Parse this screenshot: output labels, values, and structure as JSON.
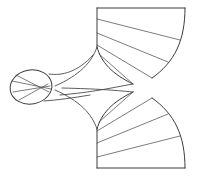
{
  "figure": {
    "background_color": "#ffffff",
    "stroke_color": "#4a4a4a",
    "outline_color": "#3c3c3c",
    "rule_color": "#5a5a5a",
    "canvas": {
      "width": 198,
      "height": 177
    },
    "parts": {
      "upper_fan": {
        "name": "upper-fan-sector",
        "top_edge": "M 97 8 L 185 8",
        "left_edge": "M 97 8 L 97 47",
        "arc_edge": "M 185 8 C 185 40 175 62 152 78",
        "inner_edge": "M 97 47 C 101 62 112 74 133 84",
        "rulings": [
          "M 97 19 L 180 40",
          "M 97 33 L 168 62",
          "M 97 45 L 152 78",
          "M 99 54 L 133 84"
        ]
      },
      "lower_fan": {
        "name": "lower-fan-sector",
        "bottom_edge": "M 97 168 L 185 168",
        "left_edge": "M 97 129 L 97 168",
        "arc_edge": "M 185 168 C 185 136 175 114 152 98",
        "inner_edge": "M 97 129 C 101 114 112 102 133 92",
        "rulings": [
          "M 97 157 L 180 136",
          "M 97 143 L 168 114",
          "M 97 131 L 152 98",
          "M 99 122 L 133 92"
        ]
      },
      "waist": {
        "name": "waist-throat",
        "upper_left_curve": "M 97 47 C 92 62 80 75 55 86",
        "lower_left_curve": "M 97 129 C 92 114 80 101 55 90",
        "upper_right_curve": "M 133 84 C 110 88 95 92 60 95",
        "lower_right_curve": "M 133 92 C 112 90 100 89 62 88"
      },
      "ellipse": {
        "name": "elliptical-disk",
        "center_x": 31,
        "center_y": 87,
        "radius_x": 21,
        "radius_y": 17,
        "rotation_deg": -10,
        "chords": [
          "M 12 81 L 51 89",
          "M 13 92 L 50 86",
          "M 16 75 L 49 92",
          "M 19 100 L 48 84"
        ]
      },
      "connector": {
        "name": "ellipse-to-body-connector",
        "upper": "M 49 74 C 62 76 78 72 93 55",
        "lower": "M 44 101 C 58 100 72 98 90 95"
      }
    }
  }
}
